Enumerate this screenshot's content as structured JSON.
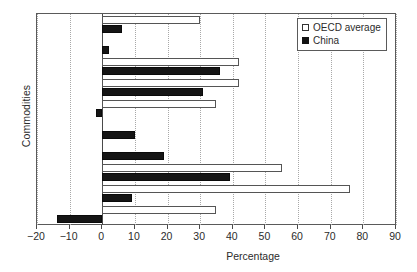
{
  "chart_data": {
    "type": "bar",
    "orientation": "horizontal",
    "title": "",
    "xlabel": "Percentage",
    "ylabel": "Commodities",
    "xlim": [
      -20,
      90
    ],
    "xticks": [
      -20,
      -10,
      0,
      10,
      20,
      30,
      40,
      50,
      60,
      70,
      80,
      90
    ],
    "xticklabels": [
      "−20",
      "−10",
      "0",
      "10",
      "20",
      "30",
      "40",
      "50",
      "60",
      "70",
      "80",
      "90"
    ],
    "grid": "vertical-dotted",
    "legend_position": "top-right",
    "categories": [
      "all",
      "livestock",
      "milk",
      "sheepmeat",
      "beef",
      "crops",
      "cotton",
      "sugar",
      "rice",
      "wheat"
    ],
    "series": [
      {
        "name": "OECD average",
        "style": "open",
        "color": "#ffffff",
        "edge": "#555555",
        "values": [
          30,
          0,
          42,
          42,
          35,
          0,
          0,
          55,
          76,
          35
        ]
      },
      {
        "name": "China",
        "style": "filled",
        "color": "#151515",
        "edge": "#0a0a0a",
        "values": [
          6,
          2,
          36,
          31,
          -2,
          10,
          19,
          39,
          9,
          -14
        ]
      }
    ]
  },
  "legend": {
    "items": [
      {
        "label": "OECD average",
        "swatch": "open-square-icon"
      },
      {
        "label": "China",
        "swatch": "filled-square-icon"
      }
    ]
  }
}
